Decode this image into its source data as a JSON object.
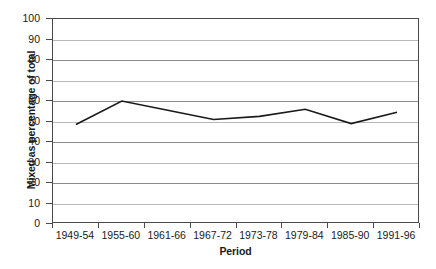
{
  "chart_data": {
    "type": "line",
    "title": "",
    "xlabel": "Period",
    "ylabel": "Mixed as percentage of total",
    "categories": [
      "1949-54",
      "1955-60",
      "1961-66",
      "1967-72",
      "1973-78",
      "1979-84",
      "1985-90",
      "1991-96"
    ],
    "values": [
      48.5,
      60,
      55.5,
      51,
      52.5,
      56,
      49,
      54.5
    ],
    "series": [
      {
        "name": "Mixed as percentage of total",
        "values": [
          48.5,
          60,
          55.5,
          51,
          52.5,
          56,
          49,
          54.5
        ]
      }
    ],
    "ylim": [
      0,
      100
    ],
    "y_ticks": [
      0,
      10,
      20,
      30,
      40,
      50,
      60,
      70,
      80,
      90,
      100
    ],
    "y_tick_labels": [
      "0",
      "10",
      "20",
      "30",
      "40",
      "50",
      "60",
      "70",
      "80",
      "90",
      "100"
    ],
    "grid": true,
    "grid_axis": "y",
    "legend": false,
    "legend_position": "none",
    "line_color": "#1a1a1a",
    "grid_color": "#8c8c8c",
    "axis_color": "#4a4a4a",
    "background": "#ffffff",
    "markers": false
  },
  "axes": {
    "y_title": "Mixed as percentage of total",
    "x_title": "Period"
  }
}
